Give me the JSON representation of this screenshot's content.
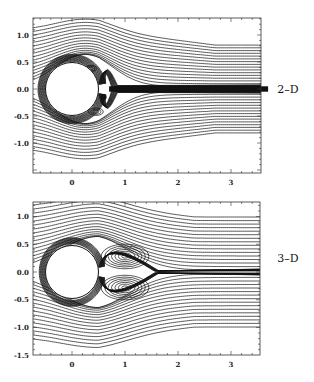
{
  "chart_data": [
    {
      "type": "streamline",
      "title": "",
      "panel_label": "2–D",
      "xlabel": "",
      "ylabel": "",
      "xlim": [
        -0.75,
        3.6
      ],
      "ylim": [
        -1.5,
        1.35
      ],
      "xticks": [
        "0",
        "1",
        "2",
        "3"
      ],
      "yticks": [
        "1.0",
        "0.5",
        "0.0",
        "-0.5",
        "-1.0"
      ],
      "grid": false,
      "cylinder": {
        "center": [
          0,
          0
        ],
        "radius": 0.5
      },
      "features": "Flow past a cylinder; thin separated wake with small asymmetric eddies behind cylinder; dense streamline band along y=0 downstream"
    },
    {
      "type": "streamline",
      "title": "",
      "panel_label": "3–D",
      "xlabel": "",
      "ylabel": "",
      "xlim": [
        -0.75,
        3.6
      ],
      "ylim": [
        -1.5,
        1.35
      ],
      "xticks": [
        "0",
        "1",
        "2",
        "3"
      ],
      "yticks": [
        "1.0",
        "0.5",
        "0.0",
        "-0.5",
        "-1.0",
        "-1.5"
      ],
      "grid": false,
      "cylinder": {
        "center": [
          0,
          0
        ],
        "radius": 0.5
      },
      "vortices": [
        {
          "x": 1.0,
          "y": 0.28
        },
        {
          "x": 1.0,
          "y": -0.28
        }
      ],
      "features": "Symmetric pair of recirculating vortices behind cylinder, closed recirculation region ending near x≈1.5"
    }
  ]
}
